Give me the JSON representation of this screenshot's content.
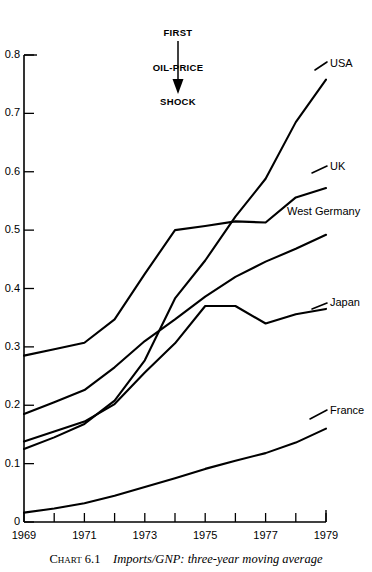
{
  "caption": {
    "chart_number": "Chart 6.1",
    "title": "Imports/GNP: three-year moving average"
  },
  "annotation": {
    "label": "FIRST\nOIL-PRICE\nSHOCK",
    "line1": "FIRST",
    "line2": "OIL-PRICE",
    "line3": "SHOCK",
    "arrow_year": 1973,
    "arrow_icon": "down-arrow-icon"
  },
  "axes": {
    "y_ticks": [
      "0",
      "0.1",
      "0.2",
      "0.3",
      "0.4",
      "0.5",
      "0.6",
      "0.7",
      "0.8"
    ],
    "y_tick_values": [
      0,
      0.1,
      0.2,
      0.3,
      0.4,
      0.5,
      0.6,
      0.7,
      0.8
    ],
    "x_ticks_all": [
      1969,
      1970,
      1971,
      1972,
      1973,
      1974,
      1975,
      1976,
      1977,
      1978,
      1979
    ],
    "x_tick_labels": [
      "1969",
      "1971",
      "1973",
      "1975",
      "1977",
      "1979"
    ],
    "x_labeled_values": [
      1969,
      1971,
      1973,
      1975,
      1977,
      1979
    ]
  },
  "series_labels": [
    {
      "name": "USA",
      "label": "USA"
    },
    {
      "name": "UK",
      "label": "UK"
    },
    {
      "name": "West Germany",
      "label": "West Germany"
    },
    {
      "name": "Japan",
      "label": "Japan"
    },
    {
      "name": "France",
      "label": "France"
    }
  ],
  "colors": {
    "line": "#000000",
    "axis": "#000000",
    "background": "#ffffff",
    "text": "#000000"
  },
  "chart_data": {
    "type": "line",
    "title": "Imports/GNP: three-year moving average",
    "xlabel": "",
    "ylabel": "",
    "xlim": [
      1969,
      1979
    ],
    "ylim": [
      0,
      0.8
    ],
    "grid": false,
    "legend_position": "right-inline-labels",
    "x": [
      1969,
      1970,
      1971,
      1972,
      1973,
      1974,
      1975,
      1976,
      1977,
      1978,
      1979
    ],
    "series": [
      {
        "name": "USA",
        "values": [
          0.125,
          0.145,
          0.168,
          0.208,
          0.277,
          0.383,
          0.448,
          0.523,
          0.588,
          0.685,
          0.758
        ]
      },
      {
        "name": "UK",
        "values": [
          0.285,
          0.296,
          0.307,
          0.347,
          0.425,
          0.5,
          0.507,
          0.515,
          0.513,
          0.556,
          0.572
        ]
      },
      {
        "name": "West Germany",
        "values": [
          0.185,
          0.205,
          0.226,
          0.265,
          0.31,
          0.347,
          0.386,
          0.42,
          0.446,
          0.468,
          0.492
        ]
      },
      {
        "name": "Japan",
        "values": [
          0.138,
          0.155,
          0.172,
          0.202,
          0.256,
          0.306,
          0.37,
          0.37,
          0.34,
          0.356,
          0.365
        ]
      },
      {
        "name": "France",
        "values": [
          0.016,
          0.023,
          0.032,
          0.045,
          0.06,
          0.075,
          0.091,
          0.105,
          0.118,
          0.136,
          0.16
        ]
      }
    ],
    "annotations": [
      {
        "text": "FIRST OIL-PRICE SHOCK",
        "x": 1973,
        "type": "arrow-down"
      }
    ]
  }
}
